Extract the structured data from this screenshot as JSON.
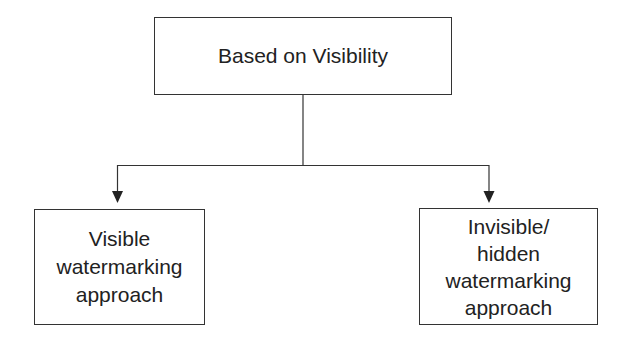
{
  "diagram": {
    "root": {
      "label": "Based on Visibility"
    },
    "children": [
      {
        "label": "Visible\nwatermarking\napproach"
      },
      {
        "label": "Invisible/\nhidden\nwatermarking\napproach"
      }
    ],
    "colors": {
      "line": "#333333",
      "text": "#222222",
      "background": "#ffffff"
    }
  }
}
